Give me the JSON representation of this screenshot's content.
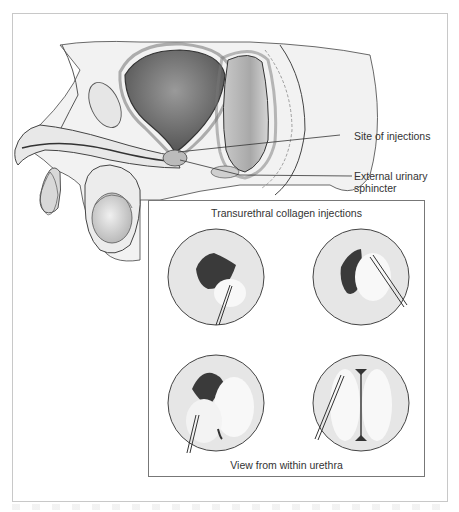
{
  "figure": {
    "labels": {
      "site_of_injections": "Site of injections",
      "external_sphincter_line1": "External urinary",
      "external_sphincter_line2": "sphincter"
    },
    "inset": {
      "title": "Transurethral collagen injections",
      "caption": "View from within urethra",
      "views": [
        {
          "step": 1,
          "description": "Needle entering bottom right of urethral opening; small bulge forming"
        },
        {
          "step": 2,
          "description": "Needle entering from right; bulge enlarging"
        },
        {
          "step": 3,
          "description": "Needle entering from bottom left; bulges meeting"
        },
        {
          "step": 4,
          "description": "Needle entering upper left; lumen closed by two bulges"
        }
      ]
    },
    "colors": {
      "line": "#333333",
      "lumen": "#3a3a3a",
      "mucosa": "#e4e4e4",
      "frame_border": "#c8c8c8",
      "inset_border": "#777777"
    }
  }
}
